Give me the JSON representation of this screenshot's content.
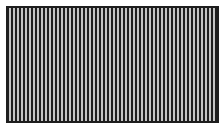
{
  "pattern": {
    "description": "Vertical stripe pattern inside dark rectangular frame",
    "frame_color": "#1e1e1e",
    "dark_stripe_color": "#1e1e1e",
    "light_stripe_color": "#c4c4c4",
    "light_stripe_count": 52
  }
}
